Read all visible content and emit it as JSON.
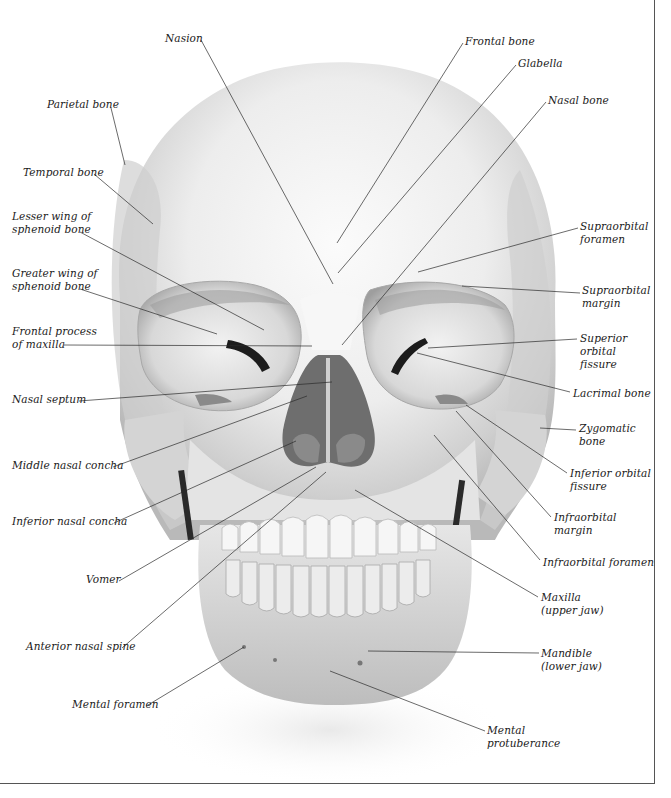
{
  "diagram": {
    "labels": [
      {
        "id": "nasion",
        "text": "Nasion",
        "x": 165,
        "y": 32,
        "align": "left",
        "tx": 201,
        "ty": 40,
        "px": 333,
        "py": 284
      },
      {
        "id": "frontal-bone",
        "text": "Frontal bone",
        "x": 465,
        "y": 35,
        "align": "left",
        "tx": 463,
        "ty": 43,
        "px": 337,
        "py": 243
      },
      {
        "id": "glabella",
        "text": "Glabella",
        "x": 518,
        "y": 57,
        "align": "left",
        "tx": 516,
        "ty": 65,
        "px": 338,
        "py": 273
      },
      {
        "id": "nasal-bone",
        "text": "Nasal bone",
        "x": 548,
        "y": 94,
        "align": "left",
        "tx": 546,
        "ty": 102,
        "px": 342,
        "py": 345
      },
      {
        "id": "parietal-bone",
        "text": "Parietal bone",
        "x": 47,
        "y": 98,
        "align": "left",
        "tx": 111,
        "ty": 108,
        "px": 125,
        "py": 165
      },
      {
        "id": "temporal-bone",
        "text": "Temporal bone",
        "x": 23,
        "y": 166,
        "align": "left",
        "tx": 94,
        "ty": 174,
        "px": 153,
        "py": 224
      },
      {
        "id": "lesser-wing",
        "text": "Lesser wing of\nsphenoid bone",
        "x": 12,
        "y": 210,
        "align": "left",
        "tx": 80,
        "ty": 232,
        "px": 264,
        "py": 330
      },
      {
        "id": "supraorbital-foramen",
        "text": "Supraorbital\nforamen",
        "x": 580,
        "y": 220,
        "align": "left",
        "tx": 578,
        "ty": 228,
        "px": 418,
        "py": 272
      },
      {
        "id": "greater-wing",
        "text": "Greater wing of\nsphenoid bone",
        "x": 12,
        "y": 267,
        "align": "left",
        "tx": 80,
        "ty": 289,
        "px": 217,
        "py": 334
      },
      {
        "id": "supraorbital-margin",
        "text": "Supraorbital\nmargin",
        "x": 582,
        "y": 284,
        "align": "left",
        "tx": 580,
        "ty": 293,
        "px": 462,
        "py": 286
      },
      {
        "id": "frontal-process",
        "text": "Frontal process\nof maxilla",
        "x": 12,
        "y": 325,
        "align": "left",
        "tx": 64,
        "ty": 345,
        "px": 312,
        "py": 346
      },
      {
        "id": "superior-orbital-fissure",
        "text": "Superior\norbital\nfissure",
        "x": 580,
        "y": 332,
        "align": "left",
        "tx": 577,
        "ty": 339,
        "px": 428,
        "py": 348
      },
      {
        "id": "nasal-septum",
        "text": "Nasal septum",
        "x": 12,
        "y": 393,
        "align": "left",
        "tx": 79,
        "ty": 401,
        "px": 332,
        "py": 382
      },
      {
        "id": "lacrimal-bone",
        "text": "Lacrimal bone",
        "x": 573,
        "y": 387,
        "align": "left",
        "tx": 570,
        "ty": 392,
        "px": 417,
        "py": 353
      },
      {
        "id": "zygomatic-bone",
        "text": "Zygomatic\nbone",
        "x": 579,
        "y": 422,
        "align": "left",
        "tx": 576,
        "ty": 430,
        "px": 540,
        "py": 428
      },
      {
        "id": "middle-nasal-concha",
        "text": "Middle nasal concha",
        "x": 12,
        "y": 459,
        "align": "left",
        "tx": 113,
        "ty": 467,
        "px": 307,
        "py": 396
      },
      {
        "id": "inferior-orbital-fissure",
        "text": "Inferior orbital\nfissure",
        "x": 570,
        "y": 467,
        "align": "left",
        "tx": 567,
        "ty": 473,
        "px": 466,
        "py": 405
      },
      {
        "id": "infraorbital-margin",
        "text": "Infraorbital\nmargin",
        "x": 554,
        "y": 511,
        "align": "left",
        "tx": 551,
        "ty": 517,
        "px": 456,
        "py": 411
      },
      {
        "id": "inferior-nasal-concha",
        "text": "Inferior nasal concha",
        "x": 12,
        "y": 515,
        "align": "left",
        "tx": 114,
        "ty": 523,
        "px": 296,
        "py": 441
      },
      {
        "id": "infraorbital-foramen",
        "text": "Infraorbital foramen",
        "x": 543,
        "y": 556,
        "align": "left",
        "tx": 540,
        "ty": 560,
        "px": 434,
        "py": 435
      },
      {
        "id": "vomer",
        "text": "Vomer",
        "x": 86,
        "y": 573,
        "align": "left",
        "tx": 119,
        "ty": 581,
        "px": 316,
        "py": 467
      },
      {
        "id": "maxilla",
        "text": "Maxilla\n(upper jaw)",
        "x": 541,
        "y": 591,
        "align": "left",
        "tx": 538,
        "ty": 597,
        "px": 355,
        "py": 490
      },
      {
        "id": "anterior-nasal-spine",
        "text": "Anterior nasal spine",
        "x": 26,
        "y": 640,
        "align": "left",
        "tx": 122,
        "ty": 648,
        "px": 326,
        "py": 472
      },
      {
        "id": "mandible",
        "text": "Mandible\n(lower jaw)",
        "x": 541,
        "y": 647,
        "align": "left",
        "tx": 539,
        "ty": 653,
        "px": 368,
        "py": 651
      },
      {
        "id": "mental-foramen",
        "text": "Mental foramen",
        "x": 72,
        "y": 698,
        "align": "left",
        "tx": 148,
        "ty": 705,
        "px": 244,
        "py": 647
      },
      {
        "id": "mental-protuberance",
        "text": "Mental\nprotuberance",
        "x": 487,
        "y": 724,
        "align": "left",
        "tx": 485,
        "ty": 731,
        "px": 330,
        "py": 671
      }
    ]
  }
}
